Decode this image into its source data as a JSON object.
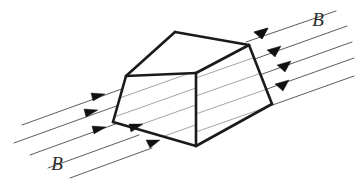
{
  "figure": {
    "type": "physics-diagram",
    "background_color": "#ffffff",
    "edge_color": "#1a1a1a",
    "field_line_color": "#4a4a4a",
    "arrow_color": "#111111",
    "label_color": "#2a2a2a"
  },
  "labels": {
    "field_label_right": "B",
    "field_label_left": "B",
    "right_label_x": 318,
    "right_label_y": 26,
    "left_label_x": 57,
    "left_label_y": 170
  },
  "solid": {
    "name": "trapezoidal-prism",
    "vertices": {
      "top_apex_left": [
        175,
        32
      ],
      "top_apex_right": [
        249,
        45
      ],
      "front_top_left": [
        126,
        76
      ],
      "front_top_right": [
        196,
        73
      ],
      "front_bottom_left": [
        113,
        122
      ],
      "front_bottom_right": [
        196,
        146
      ],
      "right_bottom": [
        272,
        104
      ]
    },
    "faces": [
      {
        "name": "top-face",
        "points": "175,32 249,45 196,73 126,76"
      },
      {
        "name": "front-face",
        "points": "126,76 196,73 196,146 113,122"
      },
      {
        "name": "right-face",
        "points": "196,73 249,45 272,104 196,146"
      }
    ],
    "edges": [
      {
        "name": "top-ridge",
        "from": "top_apex_left",
        "to": "top_apex_right"
      },
      {
        "name": "top-left-slope",
        "from": "top_apex_left",
        "to": "front_top_left"
      },
      {
        "name": "top-front-fold",
        "from": "front_top_left",
        "to": "front_top_right"
      },
      {
        "name": "top-right-fold",
        "from": "front_top_right",
        "to": "top_apex_right"
      },
      {
        "name": "front-left-edge",
        "from": "front_top_left",
        "to": "front_bottom_left"
      },
      {
        "name": "front-vertical-edge",
        "from": "front_top_right",
        "to": "front_bottom_right"
      },
      {
        "name": "front-bottom-edge",
        "from": "front_bottom_left",
        "to": "front_bottom_right"
      },
      {
        "name": "right-slope-edge",
        "from": "top_apex_right",
        "to": "right_bottom"
      },
      {
        "name": "bottom-right-edge",
        "from": "right_bottom",
        "to": "front_bottom_right"
      }
    ]
  },
  "chart_data": {
    "type": "diagram",
    "field_direction_degrees": 20,
    "field_line_count_left": 5,
    "field_line_count_right": 5,
    "field_line_count_crossing_face": 5,
    "arrow_count_left": 4,
    "arrow_count_right": 5
  }
}
